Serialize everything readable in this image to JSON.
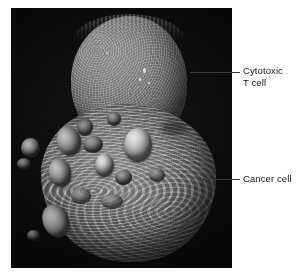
{
  "figure": {
    "kind": "sem-micrograph",
    "background_color": "#ffffff",
    "photo": {
      "name": "scanning-electron-micrograph",
      "field_color": "#050505",
      "subjects": [
        {
          "id": "t-cell",
          "description": "Cytotoxic T cell — smaller rounded upper lymphocyte with granular microvillous surface",
          "surface_color": "#8c8c8c"
        },
        {
          "id": "cancer-cell",
          "description": "Cancer cell — larger lower target cell with membrane blebs and convoluted ridges",
          "surface_color": "#8f8f8f",
          "bleb_highlight_color": "#e9e9e9"
        }
      ]
    }
  },
  "annotations": [
    {
      "id": "cytotoxic-t-cell",
      "label": "Cytotoxic\nT cell",
      "leader_color": "#3c3c3c"
    },
    {
      "id": "cancer-cell",
      "label": "Cancer cell",
      "leader_color": "#3c3c3c"
    }
  ]
}
